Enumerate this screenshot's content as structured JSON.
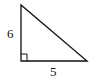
{
  "diagram": {
    "type": "right-triangle",
    "labels": {
      "vertical_leg": "6",
      "horizontal_leg": "5"
    },
    "right_angle_marker": true,
    "stroke_color": "#111111"
  }
}
